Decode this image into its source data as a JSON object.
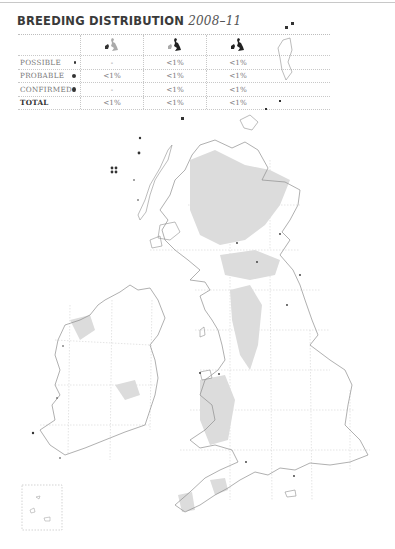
{
  "header": {
    "title": "BREEDING DISTRIBUTION",
    "years": "2008–11"
  },
  "table": {
    "columns": [
      {
        "icon": "uk-map-icon-ireland-highlighted",
        "label": ""
      },
      {
        "icon": "uk-map-icon-britain-highlighted",
        "label": ""
      },
      {
        "icon": "uk-map-icon-all-highlighted",
        "label": ""
      }
    ],
    "rows": [
      {
        "label": "POSSIBLE",
        "marker": "small-dot",
        "values": [
          "-",
          "<1%",
          "<1%"
        ]
      },
      {
        "label": "PROBABLE",
        "marker": "medium-dot",
        "values": [
          "<1%",
          "<1%",
          "<1%"
        ]
      },
      {
        "label": "CONFIRMED",
        "marker": "large-dot",
        "values": [
          "-",
          "<1%",
          "<1%"
        ]
      },
      {
        "label": "TOTAL",
        "marker": "",
        "values": [
          "<1%",
          "<1%",
          "<1%"
        ]
      }
    ]
  },
  "map": {
    "region": "Britain and Ireland",
    "upland_shading_color": "#d9d9d9",
    "coast_color": "#9a9a9a",
    "grid_color": "#c4c4c4",
    "record_color": "#333333",
    "inset": "Channel Islands"
  }
}
